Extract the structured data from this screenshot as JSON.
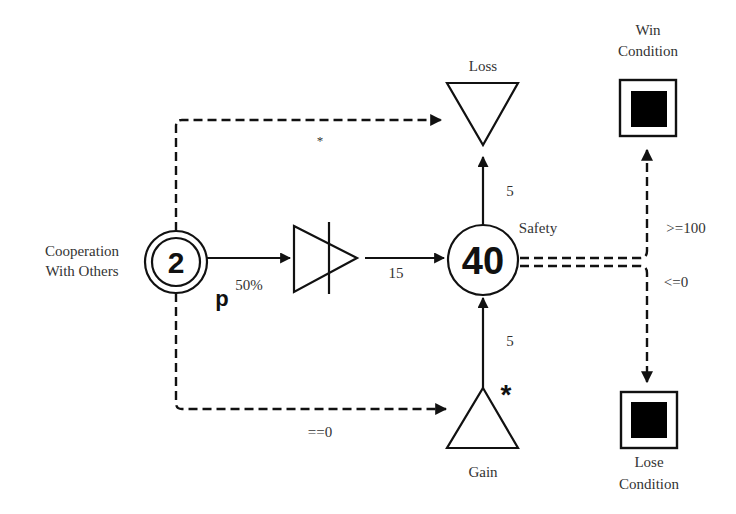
{
  "diagram": {
    "type": "machinations-flow",
    "nodes": {
      "cooperation": {
        "label_line1": "Cooperation",
        "label_line2": "With Others",
        "value": "2",
        "modifier": "p",
        "shape": "double-circle"
      },
      "gate": {
        "shape": "converter-triangle"
      },
      "safety": {
        "label": "Safety",
        "value": "40",
        "shape": "circle"
      },
      "loss": {
        "label": "Loss",
        "shape": "drain-triangle-down"
      },
      "gain": {
        "label": "Gain",
        "shape": "source-triangle-up",
        "trigger_marker": "*"
      },
      "win": {
        "label_line1": "Win",
        "label_line2": "Condition",
        "shape": "end-condition"
      },
      "lose": {
        "label_line1": "Lose",
        "label_line2": "Condition",
        "shape": "end-condition"
      }
    },
    "edges": {
      "coop_to_gate": {
        "label": "50%",
        "style": "solid"
      },
      "gate_to_safety": {
        "label": "15",
        "style": "solid"
      },
      "safety_to_loss": {
        "label": "5",
        "style": "solid"
      },
      "gain_to_safety": {
        "label": "5",
        "style": "solid"
      },
      "coop_to_loss": {
        "label": "*",
        "style": "dashed"
      },
      "coop_to_gain": {
        "label": "==0",
        "style": "dashed"
      },
      "safety_to_win": {
        "label": ">=100",
        "style": "dashed"
      },
      "safety_to_lose": {
        "label": "<=0",
        "style": "dashed"
      }
    }
  }
}
